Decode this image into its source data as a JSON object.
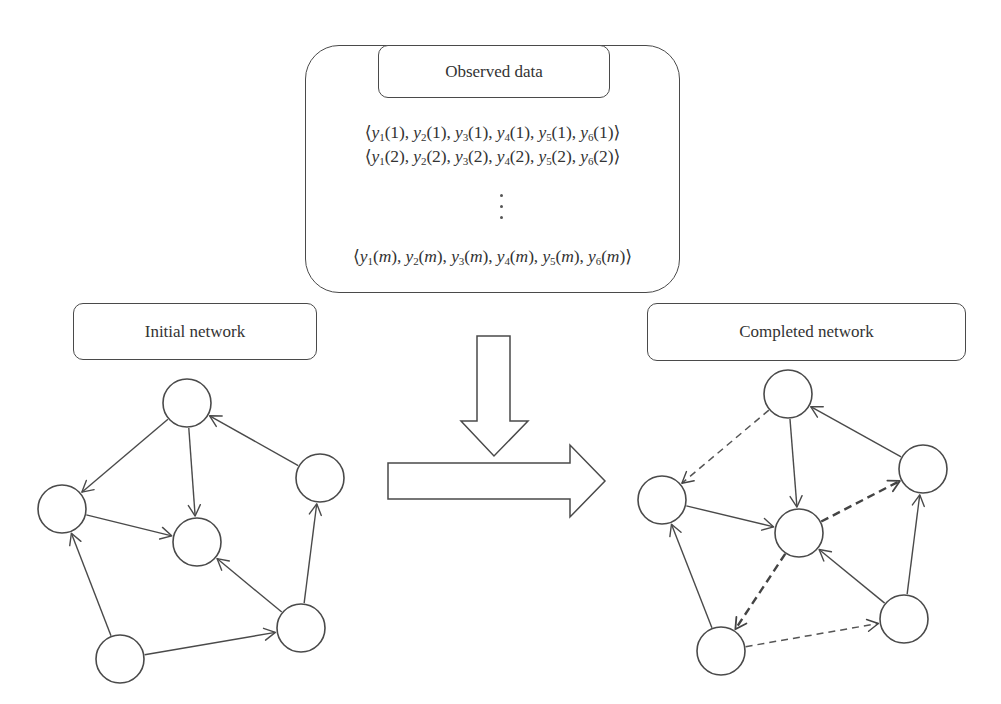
{
  "observed_data": {
    "title": "Observed data",
    "rows": [
      {
        "index": "1",
        "variables": [
          "y1",
          "y2",
          "y3",
          "y4",
          "y5",
          "y6"
        ]
      },
      {
        "index": "2",
        "variables": [
          "y1",
          "y2",
          "y3",
          "y4",
          "y5",
          "y6"
        ]
      },
      {
        "index": "m",
        "variables": [
          "y1",
          "y2",
          "y3",
          "y4",
          "y5",
          "y6"
        ]
      }
    ],
    "ellipsis": "⋮",
    "row_text": [
      "⟨y1(1), y2(1), y3(1), y4(1), y5(1), y6(1)⟩",
      "⟨y1(2), y2(2), y3(2), y4(2), y5(2), y6(2)⟩",
      "⟨y1(m), y2(m), y3(m), y4(m), y5(m), y6(m)⟩"
    ]
  },
  "initial_network": {
    "label": "Initial network",
    "nodes": [
      {
        "id": "top",
        "x": 187,
        "y": 403
      },
      {
        "id": "left",
        "x": 62,
        "y": 509
      },
      {
        "id": "center",
        "x": 197,
        "y": 542
      },
      {
        "id": "right",
        "x": 320,
        "y": 478
      },
      {
        "id": "bottom_right",
        "x": 301,
        "y": 628
      },
      {
        "id": "bottom",
        "x": 120,
        "y": 659
      }
    ],
    "edges": [
      {
        "from": "top",
        "to": "left",
        "style": "solid"
      },
      {
        "from": "top",
        "to": "center",
        "style": "solid"
      },
      {
        "from": "right",
        "to": "top",
        "style": "solid"
      },
      {
        "from": "left",
        "to": "center",
        "style": "solid"
      },
      {
        "from": "bottom_right",
        "to": "center",
        "style": "solid"
      },
      {
        "from": "bottom_right",
        "to": "right",
        "style": "solid"
      },
      {
        "from": "bottom",
        "to": "left",
        "style": "solid"
      },
      {
        "from": "bottom",
        "to": "bottom_right",
        "style": "solid"
      }
    ]
  },
  "completed_network": {
    "label": "Completed network",
    "nodes": [
      {
        "id": "top",
        "x": 788,
        "y": 394
      },
      {
        "id": "left",
        "x": 662,
        "y": 500
      },
      {
        "id": "center",
        "x": 799,
        "y": 533
      },
      {
        "id": "right",
        "x": 923,
        "y": 469
      },
      {
        "id": "bottom_right",
        "x": 904,
        "y": 619
      },
      {
        "id": "bottom",
        "x": 721,
        "y": 651
      }
    ],
    "edges": [
      {
        "from": "top",
        "to": "left",
        "style": "dashed"
      },
      {
        "from": "top",
        "to": "center",
        "style": "solid"
      },
      {
        "from": "right",
        "to": "top",
        "style": "solid"
      },
      {
        "from": "left",
        "to": "center",
        "style": "solid"
      },
      {
        "from": "center",
        "to": "right",
        "style": "dashed-bold"
      },
      {
        "from": "center",
        "to": "bottom",
        "style": "dashed-bold"
      },
      {
        "from": "bottom_right",
        "to": "center",
        "style": "solid"
      },
      {
        "from": "bottom_right",
        "to": "right",
        "style": "solid"
      },
      {
        "from": "bottom",
        "to": "left",
        "style": "solid"
      },
      {
        "from": "bottom",
        "to": "bottom_right",
        "style": "dashed"
      }
    ]
  },
  "arrows": {
    "down_arrow": "block-arrow-down",
    "right_arrow": "block-arrow-right"
  },
  "colors": {
    "stroke": "#4a4a4a",
    "text": "#333333",
    "background": "#ffffff"
  },
  "node_radius": 24
}
